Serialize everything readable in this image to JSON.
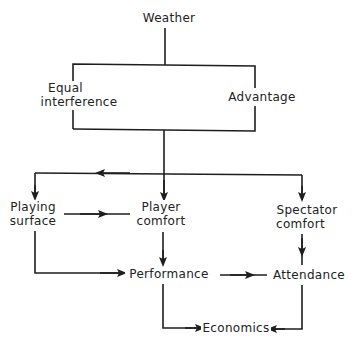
{
  "diagram": {
    "type": "flowchart",
    "colors": {
      "line": "#1e1e1e",
      "text": "#222222",
      "background": "#ffffff"
    },
    "nodes": {
      "weather": {
        "label": "Weather"
      },
      "equal_interference": {
        "line1": "Equal",
        "line2": "interference"
      },
      "advantage": {
        "label": "Advantage"
      },
      "playing_surface": {
        "line1": "Playing",
        "line2": "surface"
      },
      "player_comfort": {
        "line1": "Player",
        "line2": "comfort"
      },
      "spectator_comfort": {
        "line1": "Spectator",
        "line2": "comfort"
      },
      "performance": {
        "label": "Performance"
      },
      "attendance": {
        "label": "Attendance"
      },
      "economics": {
        "label": "Economics"
      }
    },
    "edges": [
      {
        "from": "Weather",
        "to": "Equal interference / Advantage"
      },
      {
        "from": "Equal interference / Advantage",
        "to": "Playing surface"
      },
      {
        "from": "Equal interference / Advantage",
        "to": "Player comfort"
      },
      {
        "from": "Equal interference / Advantage",
        "to": "Spectator comfort"
      },
      {
        "from": "Playing surface",
        "to": "Player comfort"
      },
      {
        "from": "Playing surface",
        "to": "Performance"
      },
      {
        "from": "Player comfort",
        "to": "Performance"
      },
      {
        "from": "Spectator comfort",
        "to": "Attendance"
      },
      {
        "from": "Performance",
        "to": "Attendance"
      },
      {
        "from": "Performance",
        "to": "Economics"
      },
      {
        "from": "Attendance",
        "to": "Economics"
      }
    ]
  }
}
